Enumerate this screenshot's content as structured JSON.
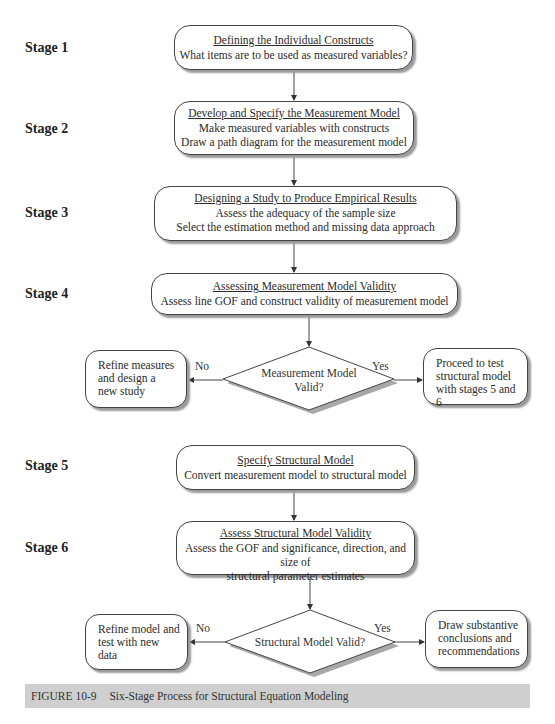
{
  "stages": [
    {
      "label": "Stage 1",
      "title": "Defining the Individual Constructs",
      "lines": [
        "What items are to be used as measured variables?"
      ]
    },
    {
      "label": "Stage 2",
      "title": "Develop and Specify the Measurement Model",
      "lines": [
        "Make measured variables with constructs",
        "Draw a path diagram for the measurement model"
      ]
    },
    {
      "label": "Stage 3",
      "title": "Designing a Study to Produce Empirical Results",
      "lines": [
        "Assess the adequacy of the sample size",
        "Select the estimation method and missing data approach"
      ]
    },
    {
      "label": "Stage 4",
      "title": "Assessing Measurement Model Validity",
      "lines": [
        "Assess line GOF and construct validity of measurement model"
      ]
    },
    {
      "label": "Stage 5",
      "title": "Specify Structural Model",
      "lines": [
        "Convert measurement model to structural model"
      ]
    },
    {
      "label": "Stage 6",
      "title": "Assess Structural Model Validity",
      "lines": [
        "Assess the GOF and significance, direction, and size of",
        "structural parameter estimates"
      ]
    }
  ],
  "decisions": [
    {
      "question_lines": [
        "Measurement Model",
        "Valid?"
      ],
      "no_label": "No",
      "yes_label": "Yes",
      "no_outcome": [
        "Refine measures",
        "and design a",
        "new study"
      ],
      "yes_outcome": [
        "Proceed to test",
        "structural model",
        "with stages 5 and 6"
      ]
    },
    {
      "question_lines": [
        "Structural Model Valid?"
      ],
      "no_label": "No",
      "yes_label": "Yes",
      "no_outcome": [
        "Refine model and",
        "test with new",
        "data"
      ],
      "yes_outcome": [
        "Draw substantive",
        "conclusions and",
        "recommendations"
      ]
    }
  ],
  "caption": {
    "number": "FIGURE 10-9",
    "text": "Six-Stage Process for Structural Equation Modeling"
  }
}
